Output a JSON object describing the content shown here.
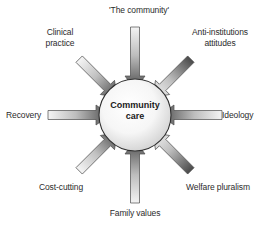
{
  "diagram": {
    "center": {
      "label": "Community\ncare",
      "shape": "circle",
      "fill_center": "#fdfdfd",
      "fill_edge": "#d2d2d2",
      "stroke": "#2f2f2f"
    },
    "arrow_style": {
      "direction": "inward",
      "tail_color": "#f2f2f2",
      "head_color": "#3d3d3d",
      "outline": "#4a4a4a"
    },
    "background": "#ffffff",
    "text_color": "#2b2b2b",
    "factors": [
      {
        "id": "the-community",
        "label": "'The community'",
        "angle_deg": 270,
        "position": "top"
      },
      {
        "id": "anti-institutions",
        "label": "Anti-institutions\nattitudes",
        "angle_deg": 315,
        "position": "top-right"
      },
      {
        "id": "ideology",
        "label": "Ideology",
        "angle_deg": 0,
        "position": "right"
      },
      {
        "id": "welfare-pluralism",
        "label": "Welfare pluralism",
        "angle_deg": 45,
        "position": "bottom-right"
      },
      {
        "id": "family-values",
        "label": "Family values",
        "angle_deg": 90,
        "position": "bottom"
      },
      {
        "id": "cost-cutting",
        "label": "Cost-cutting",
        "angle_deg": 135,
        "position": "bottom-left"
      },
      {
        "id": "recovery",
        "label": "Recovery",
        "angle_deg": 180,
        "position": "left"
      },
      {
        "id": "clinical-practice",
        "label": "Clinical\npractice",
        "angle_deg": 225,
        "position": "top-left"
      }
    ]
  }
}
